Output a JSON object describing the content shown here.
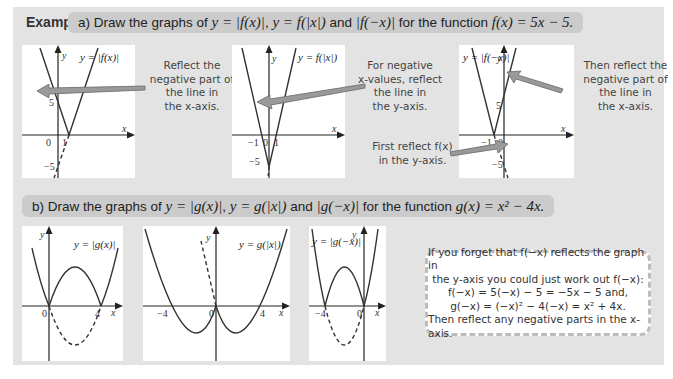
{
  "header": {
    "examples_label": "Examples:",
    "part_a": {
      "prefix": "a)  Draw the graphs of ",
      "eq1": "y = |f(x)|",
      "sep1": ", ",
      "eq2": "y = f(|x|)",
      "mid": " and ",
      "eq3": "|f(−x)|",
      "suffix": " for the function ",
      "func": "f(x) = 5x − 5."
    },
    "part_b": {
      "prefix": "b)  Draw the graphs of ",
      "eq1": "y = |g(x)|",
      "sep1": ", ",
      "eq2": "y = g(|x|)",
      "mid": " and ",
      "eq3": "|g(−x)|",
      "suffix": " for the function ",
      "func": "g(x) = x² − 4x."
    }
  },
  "graphs_a": [
    {
      "title": "y = |f(x)|",
      "ticks": {
        "y5": "5",
        "yneg5": "−5",
        "x0": "0",
        "x1": "1",
        "xlabel": "x",
        "ylabel": "y"
      }
    },
    {
      "title": "y = f(|x|)",
      "ticks": {
        "yneg5": "−5",
        "xneg1": "−1",
        "x0": "0",
        "x1": "1",
        "xlabel": "x",
        "ylabel": "y"
      }
    },
    {
      "title": "y = |f(−x)|",
      "ticks": {
        "y5": "5",
        "yneg5": "−5",
        "xneg1": "−1",
        "x0": "0",
        "xlabel": "x",
        "ylabel": "y"
      }
    }
  ],
  "graphs_b": [
    {
      "title": "y = |g(x)|",
      "ticks": {
        "x0": "0",
        "x4": "4",
        "xlabel": "x",
        "ylabel": "y"
      }
    },
    {
      "title": "y = g(|x|)",
      "ticks": {
        "xneg4": "−4",
        "x0": "0",
        "x4": "4",
        "xlabel": "x",
        "ylabel": "y"
      }
    },
    {
      "title": "y = |g(−x)|",
      "ticks": {
        "xneg4": "−4",
        "x0": "0",
        "xlabel": "x",
        "ylabel": "y"
      }
    }
  ],
  "annotations": {
    "a1": [
      "Reflect the",
      "negative part of",
      "the line in",
      "the x-axis."
    ],
    "a2": [
      "For negative",
      "x-values, reflect",
      "the line in",
      "the y-axis."
    ],
    "a3_top": [
      "Then reflect the",
      "negative part of",
      "the line in",
      "the x-axis."
    ],
    "a3_bottom": [
      "First reflect f(x)",
      "in the y-axis."
    ]
  },
  "tip_box": {
    "lines": [
      "If you forget that f(−x) reflects the graph in",
      "the y-axis you could just work out f(−x):",
      "f(−x) = 5(−x) − 5 = −5x − 5 and,",
      "g(−x) = (−x)² − 4(−x) = x² + 4x.",
      "Then reflect any negative parts in the x-axis."
    ]
  },
  "colors": {
    "panel_bg": "#e3e3e3",
    "pill_bg": "#cbcbcb",
    "graph_bg": "#ffffff",
    "curve": "#333333"
  }
}
